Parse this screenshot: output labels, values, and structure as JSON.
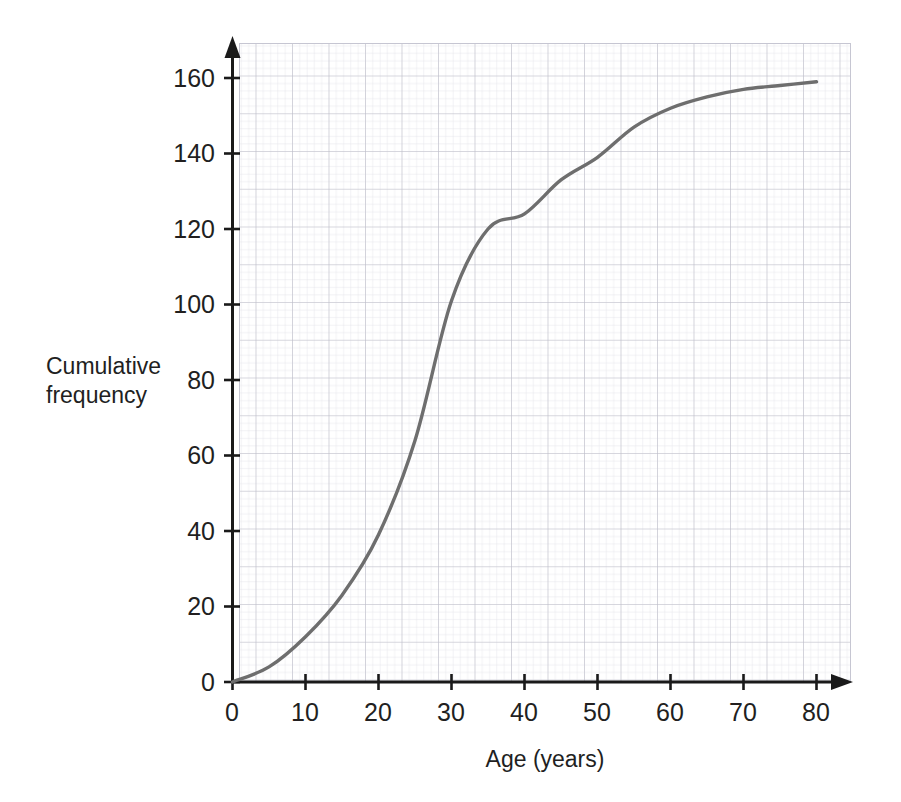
{
  "chart_data": {
    "type": "line",
    "title": "",
    "xlabel": "Age (years)",
    "ylabel": "Cumulative frequency",
    "xlim": [
      0,
      80
    ],
    "ylim": [
      0,
      168
    ],
    "xticks": [
      0,
      10,
      20,
      30,
      40,
      50,
      60,
      70,
      80
    ],
    "xtick_labels": [
      "0",
      "10",
      "20",
      "30",
      "40",
      "50",
      "60",
      "70",
      "80"
    ],
    "yticks": [
      0,
      20,
      40,
      60,
      80,
      100,
      120,
      140,
      160
    ],
    "ytick_labels": [
      "0",
      "20",
      "40",
      "60",
      "80",
      "100",
      "120",
      "140",
      "160"
    ],
    "grid": "graph-paper minor 2-unit major 10-unit",
    "legend": "none",
    "series": [
      {
        "name": "Cumulative frequency",
        "color": "#6e6e6e",
        "x": [
          0,
          5,
          10,
          15,
          20,
          25,
          30,
          35,
          40,
          45,
          50,
          55,
          60,
          65,
          70,
          75,
          80
        ],
        "y": [
          0,
          4,
          12,
          23,
          39,
          64,
          101,
          120,
          124,
          133,
          139,
          147,
          152,
          155,
          157,
          158,
          159
        ]
      }
    ],
    "curve_points": [
      {
        "age": 0,
        "cf": 0
      },
      {
        "age": 10,
        "cf": 12
      },
      {
        "age": 20,
        "cf": 39
      },
      {
        "age": 30,
        "cf": 101
      },
      {
        "age": 40,
        "cf": 124
      },
      {
        "age": 50,
        "cf": 139
      },
      {
        "age": 60,
        "cf": 152
      },
      {
        "age": 70,
        "cf": 157
      },
      {
        "age": 80,
        "cf": 159
      }
    ]
  },
  "axes": {
    "x_title": "Age (years)",
    "y_title": "Cumulative\nfrequency",
    "x_tick_labels": [
      "0",
      "10",
      "20",
      "30",
      "40",
      "50",
      "60",
      "70",
      "80"
    ],
    "y_tick_labels": [
      "0",
      "20",
      "40",
      "60",
      "80",
      "100",
      "120",
      "140",
      "160"
    ]
  },
  "colors": {
    "curve": "#6e6e6e",
    "axis": "#1a1a1a",
    "text": "#221f1f",
    "grid_minor": "#dcdce4",
    "grid_major": "#b9b9c6",
    "background": "#ffffff"
  }
}
